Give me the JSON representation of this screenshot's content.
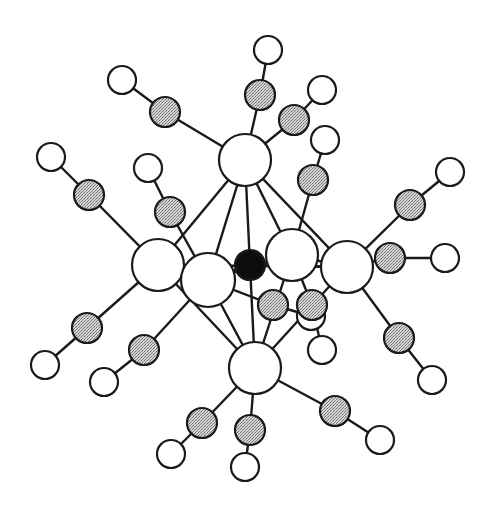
{
  "diagram": {
    "type": "molecular-structure",
    "colors": {
      "line": "#1a1a1a",
      "metal_fill": "#ffffff",
      "carbon_fill": "#bdbdbd",
      "oxygen_fill": "#ffffff",
      "center_fill": "#0d0d0d",
      "background": "#ffffff"
    },
    "center_atom": {
      "id": "X",
      "x": 250,
      "y": 265,
      "r": 15,
      "kind": "interstitial"
    },
    "metal_atoms": [
      {
        "id": "M1",
        "x": 245,
        "y": 160,
        "r": 26
      },
      {
        "id": "M2",
        "x": 158,
        "y": 265,
        "r": 26
      },
      {
        "id": "M3",
        "x": 208,
        "y": 280,
        "r": 27
      },
      {
        "id": "M4",
        "x": 292,
        "y": 255,
        "r": 26
      },
      {
        "id": "M5",
        "x": 347,
        "y": 267,
        "r": 26
      },
      {
        "id": "M6",
        "x": 255,
        "y": 368,
        "r": 26
      }
    ],
    "carbonyls": [
      {
        "metal": "M1",
        "c": {
          "x": 165,
          "y": 112
        },
        "o": {
          "x": 122,
          "y": 80
        }
      },
      {
        "metal": "M1",
        "c": {
          "x": 260,
          "y": 95
        },
        "o": {
          "x": 268,
          "y": 50
        }
      },
      {
        "metal": "M1",
        "c": {
          "x": 294,
          "y": 120
        },
        "o": {
          "x": 322,
          "y": 90
        }
      },
      {
        "metal": "M4",
        "c": {
          "x": 313,
          "y": 180
        },
        "o": {
          "x": 325,
          "y": 140
        }
      },
      {
        "metal": "M2",
        "c": {
          "x": 89,
          "y": 195
        },
        "o": {
          "x": 51,
          "y": 157
        }
      },
      {
        "metal": "M3",
        "c": {
          "x": 170,
          "y": 212
        },
        "o": {
          "x": 148,
          "y": 168
        }
      },
      {
        "metal": "M5",
        "c": {
          "x": 410,
          "y": 205
        },
        "o": {
          "x": 450,
          "y": 172
        }
      },
      {
        "metal": "M5",
        "c": {
          "x": 390,
          "y": 258
        },
        "o": {
          "x": 445,
          "y": 258
        }
      },
      {
        "metal": "M5",
        "c": {
          "x": 399,
          "y": 338
        },
        "o": {
          "x": 432,
          "y": 380
        }
      },
      {
        "metal": "M2",
        "c": {
          "x": 87,
          "y": 328
        },
        "o": {
          "x": 45,
          "y": 365
        }
      },
      {
        "metal": "M3",
        "c": {
          "x": 144,
          "y": 350
        },
        "o": {
          "x": 104,
          "y": 382
        }
      },
      {
        "metal": "M3",
        "c": {
          "x": 273,
          "y": 305
        },
        "o": {
          "x": 311,
          "y": 316
        }
      },
      {
        "metal": "M6",
        "c": {
          "x": 202,
          "y": 423
        },
        "o": {
          "x": 171,
          "y": 454
        }
      },
      {
        "metal": "M6",
        "c": {
          "x": 250,
          "y": 430
        },
        "o": {
          "x": 245,
          "y": 467
        }
      },
      {
        "metal": "M6",
        "c": {
          "x": 335,
          "y": 411
        },
        "o": {
          "x": 380,
          "y": 440
        }
      },
      {
        "metal": "M4",
        "c": {
          "x": 312,
          "y": 305
        },
        "o": {
          "x": 322,
          "y": 350
        }
      }
    ],
    "cluster_bonds": [
      [
        "M1",
        "M2"
      ],
      [
        "M1",
        "M3"
      ],
      [
        "M1",
        "M4"
      ],
      [
        "M1",
        "M5"
      ],
      [
        "M1",
        "X"
      ],
      [
        "M2",
        "M3"
      ],
      [
        "M3",
        "M4"
      ],
      [
        "M4",
        "M5"
      ],
      [
        "M2",
        "M6"
      ],
      [
        "M3",
        "M6"
      ],
      [
        "M4",
        "M6"
      ],
      [
        "M5",
        "M6"
      ],
      [
        "M6",
        "X"
      ],
      [
        "M3",
        "X"
      ],
      [
        "M5",
        "X"
      ],
      [
        "M2",
        "M5"
      ]
    ]
  }
}
